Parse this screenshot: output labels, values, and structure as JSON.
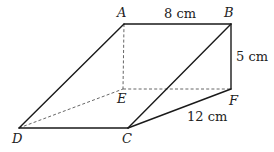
{
  "diagram": {
    "type": "triangular-prism",
    "vertices": [
      {
        "id": "A",
        "label": "A",
        "x": 124,
        "y": 24
      },
      {
        "id": "B",
        "label": "B",
        "x": 231,
        "y": 24
      },
      {
        "id": "E",
        "label": "E",
        "x": 122,
        "y": 89
      },
      {
        "id": "F",
        "label": "F",
        "x": 231,
        "y": 89
      },
      {
        "id": "D",
        "label": "D",
        "x": 19,
        "y": 128
      },
      {
        "id": "C",
        "label": "C",
        "x": 128,
        "y": 128
      }
    ],
    "edges_visible": [
      "AB",
      "BF",
      "AD",
      "BC",
      "DC",
      "CF"
    ],
    "edges_hidden": [
      "AE",
      "EF",
      "DE"
    ],
    "dimensions": {
      "AB": "8 cm",
      "BF": "5 cm",
      "CF": "12 cm"
    },
    "colors": {
      "line": "#1a1a1a",
      "dashed": "#555555",
      "text": "#222222",
      "background": "#ffffff"
    }
  }
}
